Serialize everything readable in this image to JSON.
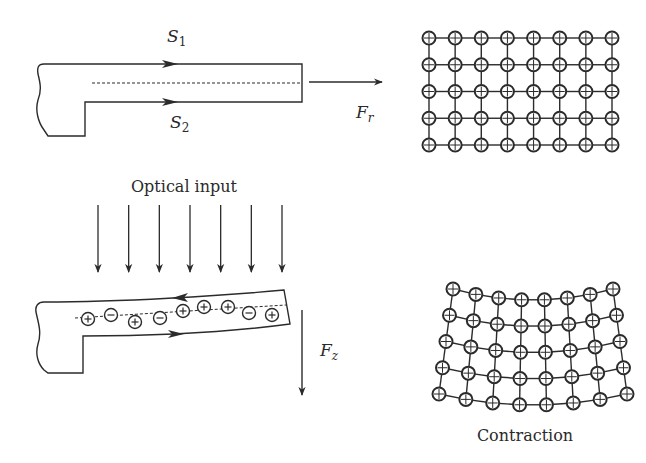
{
  "colors": {
    "ink": "#2b2b2b",
    "background": "#ffffff"
  },
  "top_panel": {
    "label_s1": {
      "main": "S",
      "sub": "1"
    },
    "label_s2": {
      "main": "S",
      "sub": "2"
    },
    "force_label": {
      "main": "F",
      "sub": "r"
    },
    "surface_flow": [
      "right",
      "right"
    ]
  },
  "top_grid": {
    "title": "",
    "rows": 5,
    "cols": 8,
    "state": "regular"
  },
  "bottom_panel": {
    "optical_input_label": "Optical input",
    "optical_arrow_count": 7,
    "force_label": {
      "main": "F",
      "sub": "z"
    },
    "surface_flow": [
      "left",
      "right"
    ],
    "charges": [
      "+",
      "-",
      "+",
      "-",
      "+",
      "+",
      "+",
      "-",
      "+"
    ]
  },
  "bottom_grid": {
    "caption": "Contraction",
    "rows": 5,
    "cols": 8,
    "state": "contracted"
  }
}
